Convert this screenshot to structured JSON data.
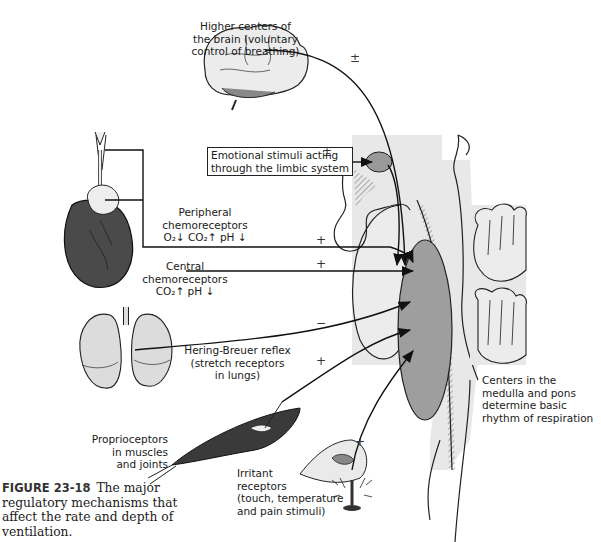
{
  "figure": {
    "number": "FIGURE 23-18",
    "caption": "The major regulatory mechanisms that affect the rate and depth of ventilation."
  },
  "labels": {
    "higher_centers": [
      "Higher centers of",
      "the brain (voluntary",
      "control of breathing)"
    ],
    "emotional": [
      "Emotional stimuli acting",
      "through the limbic system"
    ],
    "peripheral": [
      "Peripheral",
      "chemoreceptors",
      "O₂↓ CO₂↑ pH ↓"
    ],
    "central": [
      "Central",
      "chemoreceptors",
      "CO₂↑ pH ↓"
    ],
    "hering_breuer": [
      "Hering-Breuer reflex",
      "(stretch receptors",
      "in lungs)"
    ],
    "proprioceptors": [
      "Proprioceptors",
      "in muscles",
      "and joints"
    ],
    "irritant": [
      "Irritant",
      "receptors",
      "(touch, temperature",
      "and pain stimuli)"
    ],
    "centers": [
      "Centers in the",
      "medulla and pons",
      "determine basic",
      "rhythm of respiration"
    ]
  },
  "signs": {
    "higher_centers": "±",
    "emotional": "±",
    "peripheral": "+",
    "central": "+",
    "hering_breuer": "−",
    "proprioceptors": "+",
    "irritant": "+"
  },
  "colors": {
    "background": "#ffffff",
    "ink": "#1a1a1a",
    "light_gray": "#e6e6e6",
    "medulla_gray": "#9a9a9a",
    "heart_dark": "#4a4a4a",
    "muscle_dark": "#3a3a3a"
  }
}
